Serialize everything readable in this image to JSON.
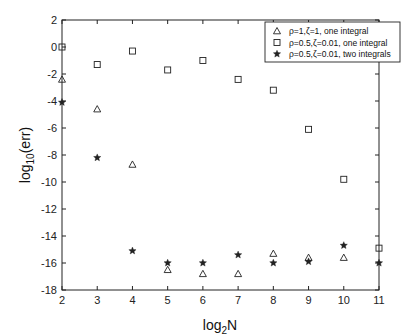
{
  "chart_data": {
    "type": "scatter",
    "title": "",
    "xlabel": "log2N",
    "ylabel": "log10(err)",
    "xlim": [
      2,
      11
    ],
    "ylim": [
      -18,
      2
    ],
    "xticks": [
      2,
      3,
      4,
      5,
      6,
      7,
      8,
      9,
      10,
      11
    ],
    "yticks": [
      2,
      0,
      -2,
      -4,
      -6,
      -8,
      -10,
      -12,
      -14,
      -16,
      -18
    ],
    "grid": false,
    "legend_position": "upper right",
    "series": [
      {
        "name": "ρ=1,ζ=1, one integral",
        "marker": "triangle",
        "x": [
          2,
          3,
          4,
          5,
          6,
          7,
          8,
          9,
          10
        ],
        "y": [
          -2.4,
          -4.6,
          -8.7,
          -16.5,
          -16.8,
          -16.8,
          -15.3,
          -15.6,
          -15.6
        ]
      },
      {
        "name": "ρ=0.5,ζ=0.01, one integral",
        "marker": "square",
        "x": [
          2,
          3,
          4,
          5,
          6,
          7,
          8,
          9,
          10,
          11
        ],
        "y": [
          0.0,
          -1.3,
          -0.3,
          -1.7,
          -1.0,
          -2.4,
          -3.2,
          -6.1,
          -9.8,
          -14.9
        ]
      },
      {
        "name": "ρ=0.5,ζ=0.01, two integrals",
        "marker": "star",
        "x": [
          2,
          3,
          4,
          5,
          6,
          7,
          8,
          9,
          10,
          11
        ],
        "y": [
          -4.1,
          -8.2,
          -15.1,
          -16.0,
          -16.0,
          -15.4,
          -16.0,
          -15.9,
          -14.7,
          -16.0
        ]
      }
    ]
  },
  "labels": {
    "xlabel_main": "log",
    "xlabel_sub": "2",
    "xlabel_tail": "N",
    "ylabel_main": "log",
    "ylabel_sub": "10",
    "ylabel_tail": "(err)"
  }
}
